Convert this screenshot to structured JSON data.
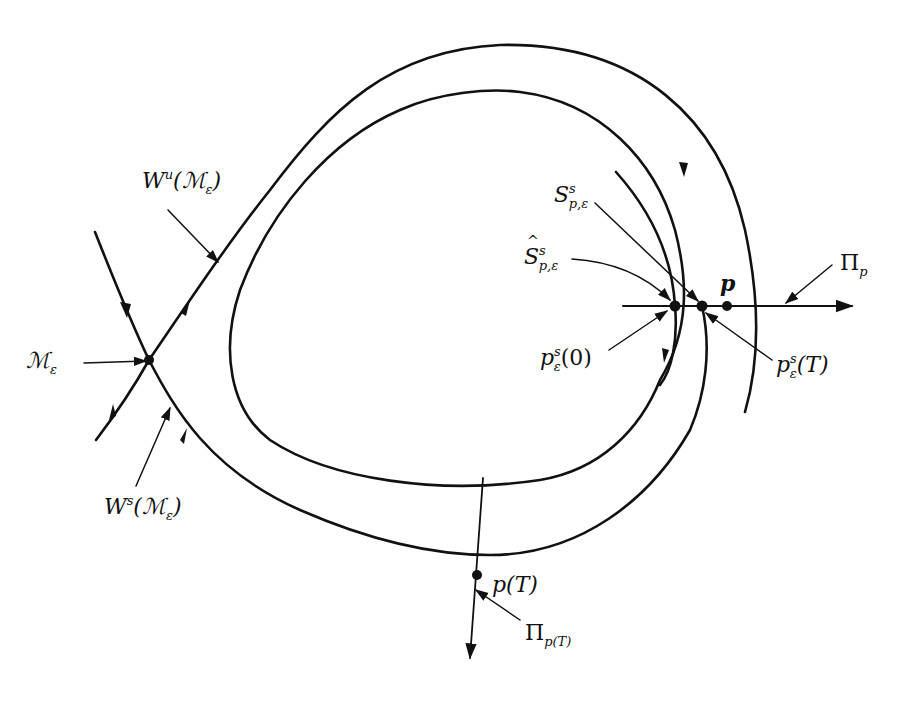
{
  "figure": {
    "type": "phase-portrait",
    "colors": {
      "ink": "#111111",
      "background": "#ffffff"
    }
  },
  "labels": {
    "unstable_manifold": {
      "base": "W",
      "sup": "u",
      "arg": "(ℳ",
      "arg_sub": "ε",
      "close": ")"
    },
    "stable_manifold": {
      "base": "W",
      "sup": "s",
      "arg": "(ℳ",
      "arg_sub": "ε",
      "close": ")"
    },
    "invariant_manifold": {
      "base": "ℳ",
      "sub": "ε"
    },
    "stable_fiber": {
      "base": "S",
      "sup": "s",
      "sub": "p,ε"
    },
    "stable_fiber_hat": {
      "base": "S",
      "sup": "s",
      "sub": "p,ε"
    },
    "point_p": {
      "text": "p"
    },
    "section_p": {
      "base": "Π",
      "sub": "p"
    },
    "point_ps0": {
      "base": "p",
      "sup": "s",
      "sub": "ε",
      "arg": "(0)"
    },
    "point_psT": {
      "base": "p",
      "sup": "s",
      "sub": "ε",
      "arg": "(T)"
    },
    "point_pT": {
      "text": "p(T)"
    },
    "section_pT": {
      "base": "Π",
      "sub": "p(T)"
    }
  },
  "points": [
    {
      "name": "M_epsilon",
      "x": 149,
      "y": 360
    },
    {
      "name": "p_s_eps_0",
      "x": 675,
      "y": 306
    },
    {
      "name": "p_s_eps_T",
      "x": 702,
      "y": 306
    },
    {
      "name": "p",
      "x": 727,
      "y": 306
    },
    {
      "name": "p_T",
      "x": 477,
      "y": 575
    }
  ]
}
